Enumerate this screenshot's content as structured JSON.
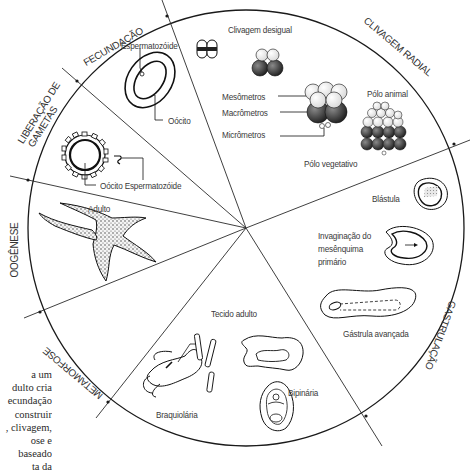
{
  "diagram": {
    "type": "life-cycle-wheel",
    "stages": [
      {
        "id": "fecundacao",
        "label": "FECUNDAÇÃO"
      },
      {
        "id": "clivagem-radial",
        "label": "CLIVAGEM RADIAL"
      },
      {
        "id": "gastrulacao",
        "label": "GASTRULAÇÃO"
      },
      {
        "id": "metamorfose",
        "label": "METAMORFOSE"
      },
      {
        "id": "oogenese",
        "label": "OOGÊNESE"
      },
      {
        "id": "liberacao-gametas",
        "label_line1": "LIBERAÇÃO DE",
        "label_line2": "GAMETAS"
      }
    ],
    "labels": {
      "espermatozoide_top": "Espermatozóide",
      "oocito_top": "Oócito",
      "oocito_esperm": "Oócito Espermatozóide",
      "adulto": "Adulto",
      "clivagem_desigual": "Clivagem desigual",
      "mesometros": "Mesômetros",
      "macrometros": "Macrômetros",
      "micrometros": "Micrômetros",
      "polo_animal": "Pólo animal",
      "polo_vegetativo": "Pólo vegetativo",
      "blastula": "Blástula",
      "invaginacao_1": "Invaginação do",
      "invaginacao_2": "mesênquima",
      "invaginacao_3": "primário",
      "gastrula": "Gástrula avançada",
      "tecido_adulto": "Tecido adulto",
      "braquiolaria": "Braquiolária",
      "bipinaria": "Bipinária"
    },
    "side_text_fragments": [
      "a um",
      "dulto cria",
      "ecundação",
      "construir",
      ", clivagem,",
      "ose e",
      "baseado",
      "ta da"
    ]
  }
}
